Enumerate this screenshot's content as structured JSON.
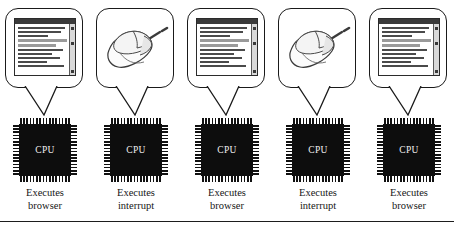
{
  "figure": {
    "type": "diagram",
    "columns": [
      {
        "bubble_icon": "browser-window-icon",
        "chip_label": "CPU",
        "caption_line1": "Executes",
        "caption_line2": "browser"
      },
      {
        "bubble_icon": "computer-mouse-icon",
        "chip_label": "CPU",
        "caption_line1": "Executes",
        "caption_line2": "interrupt"
      },
      {
        "bubble_icon": "browser-window-icon",
        "chip_label": "CPU",
        "caption_line1": "Executes",
        "caption_line2": "browser"
      },
      {
        "bubble_icon": "computer-mouse-icon",
        "chip_label": "CPU",
        "caption_line1": "Executes",
        "caption_line2": "interrupt"
      },
      {
        "bubble_icon": "browser-window-icon",
        "chip_label": "CPU",
        "caption_line1": "Executes",
        "caption_line2": "browser"
      }
    ],
    "colors": {
      "chip_body": "#0d0d0d",
      "chip_text": "#f2f2f2",
      "outline": "#1a1a1a",
      "text": "#161616",
      "page_background": "#ffffff",
      "text_line_dark": "#4a4a4a",
      "text_line_gray": "#9a9a9a"
    }
  }
}
